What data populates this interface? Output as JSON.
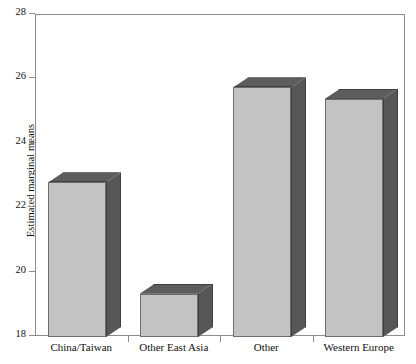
{
  "chart_data": {
    "type": "bar",
    "title": "",
    "xlabel": "",
    "ylabel": "Estimated marginal means",
    "categories": [
      "China/Taiwan",
      "Other East Asia",
      "Other",
      "Western Europe"
    ],
    "values": [
      22.8,
      19.35,
      25.75,
      25.4
    ],
    "ylim": [
      18,
      28
    ],
    "yticks": [
      18,
      20,
      22,
      24,
      26,
      28
    ],
    "ytick_labels": [
      "18",
      "20",
      "22",
      "24",
      "26",
      "28"
    ],
    "grid": false,
    "legend": null,
    "style": "3d-bar",
    "colors": {
      "bar_front": "#c3c3c3",
      "bar_side": "#575757",
      "bar_top": "#5d5d5d",
      "bar_outline": "#6e6e6e",
      "axis": "#8d8d8d",
      "background": "#ffffff",
      "text": "#111111"
    }
  }
}
